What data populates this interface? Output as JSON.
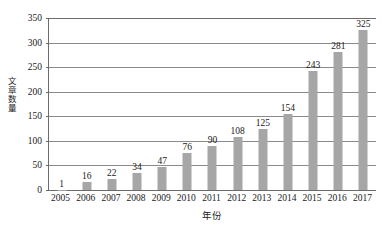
{
  "chart_data": {
    "type": "bar",
    "title": "",
    "xlabel": "年份",
    "ylabel": "文章数量",
    "categories": [
      "2005",
      "2006",
      "2007",
      "2008",
      "2009",
      "2010",
      "2011",
      "2012",
      "2013",
      "2014",
      "2015",
      "2016",
      "2017"
    ],
    "values": [
      1,
      16,
      22,
      34,
      47,
      76,
      90,
      108,
      125,
      154,
      243,
      281,
      325
    ],
    "value_labels": [
      "1",
      "16",
      "22",
      "34",
      "47",
      "76",
      "90",
      "108",
      "125",
      "154",
      "243",
      "281",
      "325"
    ],
    "ylim": [
      0,
      350
    ],
    "ytick_values": [
      0,
      50,
      100,
      150,
      200,
      250,
      300,
      350
    ],
    "ytick_labels": [
      "0",
      "50",
      "100",
      "150",
      "200",
      "250",
      "300",
      "350"
    ],
    "grid": true,
    "grid_axis": "y",
    "legend": false,
    "legend_position": "none",
    "bar_color": "#a6a6a6",
    "axis_color": "#6b6b6b",
    "grid_color": "#8a8a8a",
    "text_color": "#1a1a1a",
    "background": "#ffffff",
    "data_labels_shown": true
  }
}
